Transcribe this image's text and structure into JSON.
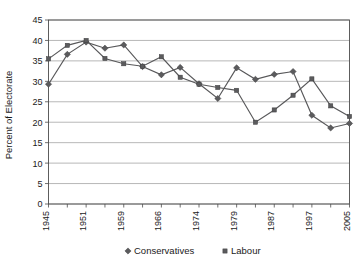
{
  "chart_data": {
    "type": "line",
    "title": "",
    "subtitle": "",
    "xlabel": "",
    "ylabel": "Percent of Electorate",
    "ylim": [
      0,
      45
    ],
    "ytick_step": 5,
    "yticks": [
      "0",
      "5",
      "10",
      "15",
      "20",
      "25",
      "30",
      "35",
      "40",
      "45"
    ],
    "grid": true,
    "grid_axis": "y",
    "legend_position": "bottom",
    "x": [
      1945,
      1950,
      1951,
      1955,
      1959,
      1964,
      1966,
      1970,
      1974.1,
      1974.8,
      1979,
      1983,
      1987,
      1992,
      1997,
      2001,
      2005
    ],
    "categories": [
      "1945",
      "1950",
      "1951",
      "1955",
      "1959",
      "1964",
      "1966",
      "1970",
      "1974F",
      "1974O",
      "1979",
      "1983",
      "1987",
      "1992",
      "1997",
      "2001",
      "2005"
    ],
    "xtick_labels": [
      "1945",
      "",
      "1951",
      "",
      "1959",
      "",
      "1966",
      "",
      "1974",
      "",
      "1979",
      "",
      "1987",
      "",
      "1997",
      "",
      "2005"
    ],
    "xtick_labels_visible": [
      "1945",
      "1951",
      "1959",
      "1966",
      "1974",
      "1979",
      "1987",
      "1997",
      "2005"
    ],
    "series": [
      {
        "name": "Conservatives",
        "marker": "diamond",
        "color": "#5b5b5d",
        "values": [
          29.3,
          36.6,
          39.6,
          38.1,
          38.9,
          33.6,
          31.6,
          33.4,
          29.4,
          25.8,
          33.3,
          30.5,
          31.7,
          32.4,
          21.7,
          18.6,
          19.7
        ]
      },
      {
        "name": "Labour",
        "marker": "square",
        "color": "#5b5b5d",
        "values": [
          35.5,
          38.8,
          40.0,
          35.6,
          34.3,
          33.7,
          36.0,
          31.0,
          29.3,
          28.5,
          27.8,
          20.0,
          23.0,
          26.6,
          30.6,
          24.0,
          21.4
        ]
      }
    ]
  },
  "legend": {
    "items": [
      {
        "label": "Conservatives",
        "marker": "diamond"
      },
      {
        "label": "Labour",
        "marker": "square"
      }
    ]
  },
  "axis": {
    "y_title": "Percent of Electorate"
  }
}
